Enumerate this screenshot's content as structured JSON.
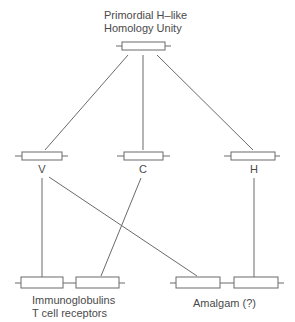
{
  "diagram": {
    "title_line1": "Primordial H–like",
    "title_line2": "Homology Unity",
    "nodes": {
      "root": {
        "label_line1": "Primordial H–like",
        "label_line2": "Homology Unity"
      },
      "v": {
        "label": "V"
      },
      "c": {
        "label": "C"
      },
      "h": {
        "label": "H"
      },
      "ig_tcr": {
        "label_line1": "Immunoglobulins",
        "label_line2": "T cell receptors"
      },
      "amalgam": {
        "label": "Amalgam (?)"
      }
    },
    "edges": [
      {
        "from": "root",
        "to": "v"
      },
      {
        "from": "root",
        "to": "c"
      },
      {
        "from": "root",
        "to": "h"
      },
      {
        "from": "v",
        "to": "ig_tcr"
      },
      {
        "from": "c",
        "to": "ig_tcr"
      },
      {
        "from": "v",
        "to": "amalgam"
      },
      {
        "from": "h",
        "to": "amalgam"
      }
    ],
    "colors": {
      "line": "#6a6a6a",
      "text": "#4a4a4a",
      "background": "#ffffff"
    }
  }
}
